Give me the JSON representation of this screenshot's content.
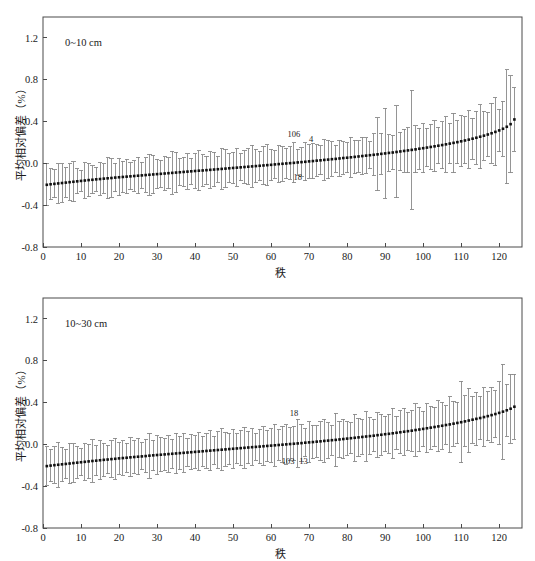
{
  "figure": {
    "width": 535,
    "height": 561,
    "background": "#ffffff",
    "panel_count": 2
  },
  "style": {
    "axis_color": "#4a4a4a",
    "errorbar_color": "#8a8a8a",
    "marker_color": "#101010",
    "text_color": "#1a1a1a"
  },
  "chart_data": [
    {
      "id": "panel-top",
      "type": "scatter",
      "title": "",
      "subtitle": "0~10 cm",
      "xlabel": "秩",
      "ylabel": "平均相对偏差（%）",
      "xlim": [
        0,
        126
      ],
      "ylim": [
        -0.8,
        1.4
      ],
      "xticks": [
        0,
        10,
        20,
        30,
        40,
        50,
        60,
        70,
        80,
        90,
        100,
        110,
        120
      ],
      "xticklabels": [
        "0",
        "10",
        "20",
        "30",
        "40",
        "50",
        "60",
        "70",
        "80",
        "90",
        "100",
        "110",
        "120"
      ],
      "yticks": [
        -0.8,
        -0.4,
        0.0,
        0.4,
        0.8,
        1.2
      ],
      "yticklabels": [
        "-0.8",
        "-0.4",
        "0.0",
        "0.4",
        "0.8",
        "1.2"
      ],
      "grid": false,
      "legend": null,
      "error_bars": true,
      "annotations": [
        {
          "text": "106",
          "x": 66,
          "y": 0.255
        },
        {
          "text": "4",
          "x": 70.5,
          "y": 0.205
        },
        {
          "text": "18",
          "x": 67,
          "y": -0.155
        }
      ],
      "x": [
        1,
        2,
        3,
        4,
        5,
        6,
        7,
        8,
        9,
        10,
        11,
        12,
        13,
        14,
        15,
        16,
        17,
        18,
        19,
        20,
        21,
        22,
        23,
        24,
        25,
        26,
        27,
        28,
        29,
        30,
        31,
        32,
        33,
        34,
        35,
        36,
        37,
        38,
        39,
        40,
        41,
        42,
        43,
        44,
        45,
        46,
        47,
        48,
        49,
        50,
        51,
        52,
        53,
        54,
        55,
        56,
        57,
        58,
        59,
        60,
        61,
        62,
        63,
        64,
        65,
        66,
        67,
        68,
        69,
        70,
        71,
        72,
        73,
        74,
        75,
        76,
        77,
        78,
        79,
        80,
        81,
        82,
        83,
        84,
        85,
        86,
        87,
        88,
        89,
        90,
        91,
        92,
        93,
        94,
        95,
        96,
        97,
        98,
        99,
        100,
        101,
        102,
        103,
        104,
        105,
        106,
        107,
        108,
        109,
        110,
        111,
        112,
        113,
        114,
        115,
        116,
        117,
        118,
        119,
        120,
        121,
        122,
        123,
        124
      ],
      "y": [
        -0.205,
        -0.2,
        -0.196,
        -0.192,
        -0.188,
        -0.184,
        -0.18,
        -0.176,
        -0.172,
        -0.168,
        -0.164,
        -0.16,
        -0.157,
        -0.153,
        -0.15,
        -0.146,
        -0.143,
        -0.14,
        -0.136,
        -0.133,
        -0.13,
        -0.127,
        -0.124,
        -0.121,
        -0.118,
        -0.115,
        -0.112,
        -0.109,
        -0.106,
        -0.103,
        -0.1,
        -0.097,
        -0.094,
        -0.091,
        -0.088,
        -0.085,
        -0.082,
        -0.079,
        -0.076,
        -0.073,
        -0.07,
        -0.068,
        -0.065,
        -0.062,
        -0.059,
        -0.056,
        -0.053,
        -0.05,
        -0.047,
        -0.044,
        -0.041,
        -0.038,
        -0.035,
        -0.032,
        -0.029,
        -0.026,
        -0.023,
        -0.02,
        -0.017,
        -0.014,
        -0.01,
        -0.007,
        -0.004,
        -0.001,
        0.002,
        0.005,
        0.009,
        0.012,
        0.015,
        0.019,
        0.022,
        0.026,
        0.029,
        0.033,
        0.036,
        0.04,
        0.043,
        0.047,
        0.051,
        0.054,
        0.058,
        0.062,
        0.066,
        0.07,
        0.074,
        0.078,
        0.082,
        0.086,
        0.091,
        0.095,
        0.1,
        0.104,
        0.109,
        0.114,
        0.119,
        0.124,
        0.129,
        0.134,
        0.14,
        0.145,
        0.151,
        0.157,
        0.163,
        0.169,
        0.175,
        0.182,
        0.189,
        0.196,
        0.203,
        0.211,
        0.219,
        0.227,
        0.236,
        0.245,
        0.255,
        0.265,
        0.276,
        0.288,
        0.301,
        0.315,
        0.331,
        0.35,
        0.375,
        0.42,
        0.54
      ],
      "yerr": [
        0.2,
        0.15,
        0.135,
        0.19,
        0.185,
        0.14,
        0.175,
        0.19,
        0.12,
        0.1,
        0.17,
        0.16,
        0.135,
        0.115,
        0.155,
        0.14,
        0.195,
        0.185,
        0.135,
        0.175,
        0.15,
        0.165,
        0.13,
        0.145,
        0.175,
        0.125,
        0.165,
        0.195,
        0.185,
        0.14,
        0.13,
        0.16,
        0.15,
        0.205,
        0.195,
        0.13,
        0.14,
        0.17,
        0.125,
        0.165,
        0.19,
        0.15,
        0.135,
        0.175,
        0.165,
        0.125,
        0.195,
        0.185,
        0.14,
        0.15,
        0.18,
        0.13,
        0.155,
        0.17,
        0.2,
        0.16,
        0.14,
        0.185,
        0.195,
        0.15,
        0.13,
        0.175,
        0.165,
        0.145,
        0.155,
        0.19,
        0.125,
        0.135,
        0.18,
        0.16,
        0.17,
        0.15,
        0.14,
        0.195,
        0.185,
        0.165,
        0.13,
        0.175,
        0.155,
        0.145,
        0.19,
        0.16,
        0.15,
        0.18,
        0.17,
        0.13,
        0.2,
        0.35,
        0.195,
        0.43,
        0.175,
        0.165,
        0.44,
        0.185,
        0.205,
        0.215,
        0.57,
        0.225,
        0.195,
        0.235,
        0.185,
        0.215,
        0.245,
        0.175,
        0.225,
        0.265,
        0.195,
        0.285,
        0.205,
        0.245,
        0.225,
        0.275,
        0.195,
        0.255,
        0.305,
        0.235,
        0.215,
        0.285,
        0.325,
        0.205,
        0.265,
        0.545,
        0.465,
        0.305
      ]
    },
    {
      "id": "panel-bottom",
      "type": "scatter",
      "title": "",
      "subtitle": "10~30 cm",
      "xlabel": "秩",
      "ylabel": "平均相对偏差（%）",
      "xlim": [
        0,
        126
      ],
      "ylim": [
        -0.8,
        1.4
      ],
      "xticks": [
        0,
        10,
        20,
        30,
        40,
        50,
        60,
        70,
        80,
        90,
        100,
        110,
        120
      ],
      "xticklabels": [
        "0",
        "10",
        "20",
        "30",
        "40",
        "50",
        "60",
        "70",
        "80",
        "90",
        "100",
        "110",
        "120"
      ],
      "yticks": [
        -0.8,
        -0.4,
        0.0,
        0.4,
        0.8,
        1.2
      ],
      "yticklabels": [
        "-0.8",
        "-0.4",
        "0.0",
        "0.4",
        "0.8",
        "1.2"
      ],
      "grid": false,
      "legend": null,
      "error_bars": true,
      "annotations": [
        {
          "text": "18",
          "x": 66,
          "y": 0.27
        },
        {
          "text": "103",
          "x": 64.5,
          "y": -0.185
        },
        {
          "text": "13",
          "x": 68.5,
          "y": -0.19
        }
      ],
      "x": [
        1,
        2,
        3,
        4,
        5,
        6,
        7,
        8,
        9,
        10,
        11,
        12,
        13,
        14,
        15,
        16,
        17,
        18,
        19,
        20,
        21,
        22,
        23,
        24,
        25,
        26,
        27,
        28,
        29,
        30,
        31,
        32,
        33,
        34,
        35,
        36,
        37,
        38,
        39,
        40,
        41,
        42,
        43,
        44,
        45,
        46,
        47,
        48,
        49,
        50,
        51,
        52,
        53,
        54,
        55,
        56,
        57,
        58,
        59,
        60,
        61,
        62,
        63,
        64,
        65,
        66,
        67,
        68,
        69,
        70,
        71,
        72,
        73,
        74,
        75,
        76,
        77,
        78,
        79,
        80,
        81,
        82,
        83,
        84,
        85,
        86,
        87,
        88,
        89,
        90,
        91,
        92,
        93,
        94,
        95,
        96,
        97,
        98,
        99,
        100,
        101,
        102,
        103,
        104,
        105,
        106,
        107,
        108,
        109,
        110,
        111,
        112,
        113,
        114,
        115,
        116,
        117,
        118,
        119,
        120,
        121,
        122,
        123,
        124
      ],
      "y": [
        -0.208,
        -0.203,
        -0.199,
        -0.195,
        -0.191,
        -0.187,
        -0.183,
        -0.179,
        -0.175,
        -0.171,
        -0.167,
        -0.163,
        -0.159,
        -0.156,
        -0.152,
        -0.148,
        -0.145,
        -0.141,
        -0.138,
        -0.134,
        -0.131,
        -0.128,
        -0.124,
        -0.121,
        -0.118,
        -0.115,
        -0.112,
        -0.108,
        -0.105,
        -0.102,
        -0.099,
        -0.096,
        -0.093,
        -0.09,
        -0.087,
        -0.084,
        -0.081,
        -0.078,
        -0.075,
        -0.072,
        -0.069,
        -0.066,
        -0.063,
        -0.06,
        -0.057,
        -0.054,
        -0.051,
        -0.048,
        -0.045,
        -0.042,
        -0.039,
        -0.036,
        -0.033,
        -0.03,
        -0.027,
        -0.024,
        -0.021,
        -0.018,
        -0.015,
        -0.012,
        -0.009,
        -0.006,
        -0.003,
        0.0,
        0.003,
        0.006,
        0.009,
        0.012,
        0.016,
        0.019,
        0.022,
        0.026,
        0.029,
        0.033,
        0.036,
        0.04,
        0.043,
        0.047,
        0.051,
        0.055,
        0.059,
        0.063,
        0.067,
        0.071,
        0.075,
        0.079,
        0.083,
        0.088,
        0.092,
        0.097,
        0.101,
        0.106,
        0.111,
        0.116,
        0.121,
        0.126,
        0.131,
        0.137,
        0.142,
        0.148,
        0.154,
        0.16,
        0.166,
        0.172,
        0.178,
        0.185,
        0.191,
        0.198,
        0.205,
        0.212,
        0.22,
        0.228,
        0.236,
        0.244,
        0.252,
        0.261,
        0.27,
        0.28,
        0.29,
        0.301,
        0.313,
        0.326,
        0.341,
        0.36,
        0.385
      ],
      "yerr": [
        0.185,
        0.155,
        0.175,
        0.215,
        0.165,
        0.14,
        0.195,
        0.185,
        0.15,
        0.13,
        0.175,
        0.165,
        0.205,
        0.145,
        0.185,
        0.16,
        0.135,
        0.175,
        0.195,
        0.15,
        0.165,
        0.14,
        0.185,
        0.155,
        0.175,
        0.13,
        0.16,
        0.215,
        0.145,
        0.185,
        0.165,
        0.15,
        0.175,
        0.14,
        0.195,
        0.16,
        0.185,
        0.13,
        0.17,
        0.155,
        0.18,
        0.145,
        0.165,
        0.19,
        0.135,
        0.175,
        0.2,
        0.16,
        0.15,
        0.185,
        0.14,
        0.17,
        0.195,
        0.155,
        0.175,
        0.13,
        0.165,
        0.185,
        0.15,
        0.16,
        0.2,
        0.145,
        0.175,
        0.19,
        0.155,
        0.165,
        0.23,
        0.18,
        0.135,
        0.195,
        0.16,
        0.15,
        0.185,
        0.205,
        0.17,
        0.145,
        0.255,
        0.175,
        0.19,
        0.16,
        0.15,
        0.225,
        0.185,
        0.165,
        0.235,
        0.175,
        0.155,
        0.215,
        0.195,
        0.17,
        0.185,
        0.24,
        0.16,
        0.205,
        0.225,
        0.18,
        0.195,
        0.25,
        0.215,
        0.17,
        0.235,
        0.205,
        0.19,
        0.245,
        0.225,
        0.185,
        0.265,
        0.215,
        0.2,
        0.39,
        0.245,
        0.31,
        0.225,
        0.255,
        0.21,
        0.28,
        0.235,
        0.265,
        0.225,
        0.3,
        0.455,
        0.25,
        0.33,
        0.31
      ]
    }
  ]
}
